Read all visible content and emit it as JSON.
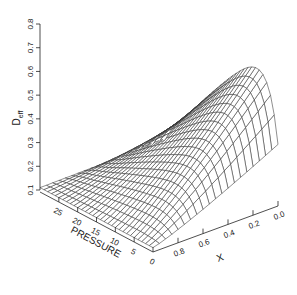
{
  "chart_data": {
    "type": "surface3d",
    "title": "",
    "zlabel": "D_eff",
    "zlabel_main": "D",
    "zlabel_sub": "eff",
    "xlabel": "X",
    "ylabel": "PRESSURE",
    "zlim": [
      0.1,
      0.8
    ],
    "xlim": [
      0.0,
      1.0
    ],
    "ylim": [
      0,
      30
    ],
    "z_ticks": [
      "0.1",
      "0.2",
      "0.3",
      "0.4",
      "0.5",
      "0.6",
      "0.7",
      "0.8"
    ],
    "x_ticks": [
      "0.8",
      "0.6",
      "0.4",
      "0.2",
      "0.0"
    ],
    "pressure_ticks": [
      "25",
      "20",
      "15",
      "10",
      "5",
      "0"
    ],
    "grid": false,
    "sample_points": [
      {
        "x": 0.0,
        "pressure": 0,
        "deff": 0.8
      },
      {
        "x": 0.0,
        "pressure": 30,
        "deff": 0.15
      },
      {
        "x": 1.0,
        "pressure": 0,
        "deff": 0.2
      },
      {
        "x": 1.0,
        "pressure": 30,
        "deff": 0.1
      }
    ]
  }
}
